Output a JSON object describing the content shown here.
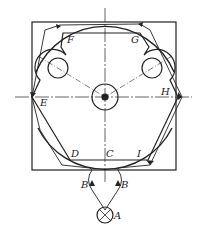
{
  "diagram": {
    "type": "mechanical belt-grinding path schematic",
    "labels": {
      "F": "F",
      "G": "G",
      "E": "E",
      "H": "H",
      "D": "D",
      "C": "C",
      "I": "I",
      "B_left": "B",
      "B_right": "B",
      "A": "A"
    },
    "colors": {
      "line": "#222222",
      "background": "#ffffff"
    }
  }
}
